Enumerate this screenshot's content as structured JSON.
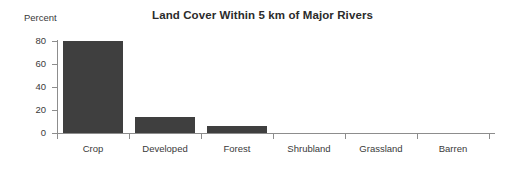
{
  "chart_data": {
    "type": "bar",
    "title": "Land Cover Within 5 km of Major Rivers",
    "xlabel": "",
    "ylabel": "Percent",
    "categories": [
      "Crop",
      "Developed",
      "Forest",
      "Shrubland",
      "Grassland",
      "Barren"
    ],
    "values": [
      80,
      14,
      6,
      0,
      0,
      0
    ],
    "ylim": [
      0,
      80
    ],
    "yticks": [
      0,
      20,
      40,
      60,
      80
    ],
    "ytick_labels": [
      "0",
      "20",
      "40",
      "60",
      "80"
    ],
    "grid": false,
    "legend": null,
    "series": [
      {
        "name": "Percent",
        "values": [
          80,
          14,
          6,
          0,
          0,
          0
        ]
      }
    ],
    "bar_color": "#3f3f3f",
    "axis_color": "#8d8d8d",
    "background_color": "#ffffff",
    "text_color": "#3a3a3a"
  }
}
